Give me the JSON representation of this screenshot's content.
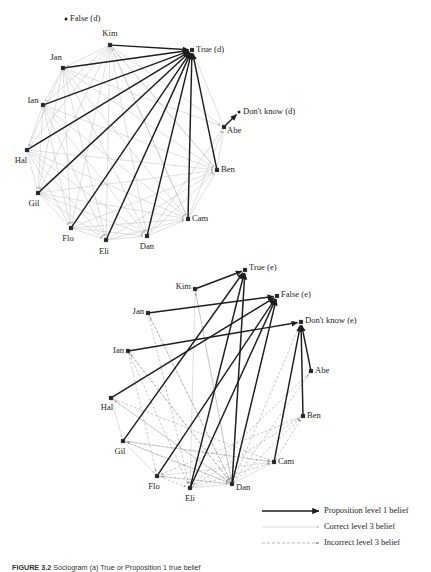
{
  "figure": {
    "caption_prefix": "FIGURE 3.2",
    "caption_text": "Sociogram (a) True or Proposition 1 true belief"
  },
  "colors": {
    "level1": "#1d1d1d",
    "correct3": "#b8b8b8",
    "incorrect3": "#9a9a9a",
    "node": "#222222",
    "text": "#1d1d1d"
  },
  "legend": {
    "items": [
      {
        "label": "Proposition level 1 belief",
        "style": "solid-thick",
        "color": "#1d1d1d"
      },
      {
        "label": "Correct level 3 belief",
        "style": "solid-thin",
        "color": "#bdbdbd"
      },
      {
        "label": "Incorrect level 3 belief",
        "style": "dashed",
        "color": "#9a9a9a"
      }
    ]
  },
  "chart_data": {
    "type": "diagram",
    "subtype": "directed-network",
    "panels": [
      {
        "id": "panel-d",
        "name": "dispositional-network",
        "suffix": "(d)",
        "nodes": [
          {
            "id": "False_d",
            "label": "False (d)",
            "x": 66,
            "y": 19,
            "lx": 70,
            "ly": 19,
            "anchor": "start",
            "kind": "proposition",
            "marker": "dot"
          },
          {
            "id": "Kim",
            "label": "Kim",
            "x": 110,
            "y": 45,
            "lx": 110,
            "ly": 34,
            "anchor": "middle",
            "kind": "agent",
            "marker": "square"
          },
          {
            "id": "True_d",
            "label": "True (d)",
            "x": 192,
            "y": 50,
            "lx": 196,
            "ly": 50,
            "anchor": "start",
            "kind": "proposition",
            "marker": "square"
          },
          {
            "id": "Jan",
            "label": "Jan",
            "x": 63,
            "y": 68,
            "lx": 56,
            "ly": 58,
            "anchor": "middle",
            "kind": "agent",
            "marker": "square"
          },
          {
            "id": "Ian",
            "label": "Ian",
            "x": 43,
            "y": 105,
            "lx": 33,
            "ly": 101,
            "anchor": "middle",
            "kind": "agent",
            "marker": "square"
          },
          {
            "id": "Dk_d",
            "label": "Don't know (d)",
            "x": 239,
            "y": 112,
            "lx": 243,
            "ly": 112,
            "anchor": "start",
            "kind": "proposition",
            "marker": "dot"
          },
          {
            "id": "Abe",
            "label": "Abe",
            "x": 224,
            "y": 127,
            "lx": 227,
            "ly": 131,
            "anchor": "start",
            "kind": "agent",
            "marker": "square"
          },
          {
            "id": "Hal",
            "label": "Hal",
            "x": 27,
            "y": 150,
            "lx": 21,
            "ly": 161,
            "anchor": "middle",
            "kind": "agent",
            "marker": "square"
          },
          {
            "id": "Ben",
            "label": "Ben",
            "x": 217,
            "y": 170,
            "lx": 221,
            "ly": 170,
            "anchor": "start",
            "kind": "agent",
            "marker": "square"
          },
          {
            "id": "Gil",
            "label": "Gil",
            "x": 38,
            "y": 193,
            "lx": 34,
            "ly": 204,
            "anchor": "middle",
            "kind": "agent",
            "marker": "square"
          },
          {
            "id": "Cam",
            "label": "Cam",
            "x": 188,
            "y": 219,
            "lx": 192,
            "ly": 219,
            "anchor": "start",
            "kind": "agent",
            "marker": "square"
          },
          {
            "id": "Flo",
            "label": "Flo",
            "x": 71,
            "y": 228,
            "lx": 68,
            "ly": 239,
            "anchor": "middle",
            "kind": "agent",
            "marker": "square"
          },
          {
            "id": "Dan",
            "label": "Dan",
            "x": 147,
            "y": 236,
            "lx": 147,
            "ly": 247,
            "anchor": "middle",
            "kind": "agent",
            "marker": "square"
          },
          {
            "id": "Eli",
            "label": "Eli",
            "x": 106,
            "y": 240,
            "lx": 104,
            "ly": 252,
            "anchor": "middle",
            "kind": "agent",
            "marker": "square"
          }
        ],
        "edges_level1": [
          [
            "Kim",
            "True_d"
          ],
          [
            "Jan",
            "True_d"
          ],
          [
            "Ian",
            "True_d"
          ],
          [
            "Hal",
            "True_d"
          ],
          [
            "Gil",
            "True_d"
          ],
          [
            "Flo",
            "True_d"
          ],
          [
            "Eli",
            "True_d"
          ],
          [
            "Dan",
            "True_d"
          ],
          [
            "Cam",
            "True_d"
          ],
          [
            "Ben",
            "True_d"
          ],
          [
            "Abe",
            "Dk_d"
          ]
        ],
        "edges_correct3": [
          [
            "Kim",
            "Jan"
          ],
          [
            "Kim",
            "Ian"
          ],
          [
            "Kim",
            "Hal"
          ],
          [
            "Kim",
            "Gil"
          ],
          [
            "Kim",
            "Flo"
          ],
          [
            "Kim",
            "Eli"
          ],
          [
            "Kim",
            "Dan"
          ],
          [
            "Kim",
            "Cam"
          ],
          [
            "Kim",
            "Ben"
          ],
          [
            "Kim",
            "Abe"
          ],
          [
            "Jan",
            "Ian"
          ],
          [
            "Jan",
            "Hal"
          ],
          [
            "Jan",
            "Gil"
          ],
          [
            "Jan",
            "Flo"
          ],
          [
            "Jan",
            "Eli"
          ],
          [
            "Jan",
            "Dan"
          ],
          [
            "Jan",
            "Cam"
          ],
          [
            "Jan",
            "Ben"
          ],
          [
            "Jan",
            "Abe"
          ],
          [
            "Ian",
            "Hal"
          ],
          [
            "Ian",
            "Gil"
          ],
          [
            "Ian",
            "Flo"
          ],
          [
            "Ian",
            "Eli"
          ],
          [
            "Ian",
            "Dan"
          ],
          [
            "Ian",
            "Cam"
          ],
          [
            "Ian",
            "Ben"
          ],
          [
            "Hal",
            "Gil"
          ],
          [
            "Hal",
            "Flo"
          ],
          [
            "Hal",
            "Eli"
          ],
          [
            "Hal",
            "Dan"
          ],
          [
            "Hal",
            "Cam"
          ],
          [
            "Hal",
            "Ben"
          ],
          [
            "Gil",
            "Flo"
          ],
          [
            "Gil",
            "Eli"
          ],
          [
            "Gil",
            "Dan"
          ],
          [
            "Gil",
            "Cam"
          ],
          [
            "Gil",
            "Ben"
          ],
          [
            "Flo",
            "Eli"
          ],
          [
            "Flo",
            "Dan"
          ],
          [
            "Flo",
            "Cam"
          ],
          [
            "Flo",
            "Ben"
          ],
          [
            "Eli",
            "Dan"
          ],
          [
            "Eli",
            "Cam"
          ],
          [
            "Eli",
            "Ben"
          ],
          [
            "Dan",
            "Cam"
          ],
          [
            "Dan",
            "Ben"
          ],
          [
            "Dan",
            "Abe"
          ],
          [
            "Cam",
            "Ben"
          ],
          [
            "Cam",
            "Abe"
          ],
          [
            "Ben",
            "Abe"
          ],
          [
            "Abe",
            "True_d"
          ],
          [
            "Ben",
            "Kim"
          ],
          [
            "Cam",
            "Kim"
          ]
        ],
        "edges_incorrect3": []
      },
      {
        "id": "panel-e",
        "name": "episodic-network",
        "suffix": "(e)",
        "nodes": [
          {
            "id": "True_e",
            "label": "True (e)",
            "x": 245,
            "y": 270,
            "lx": 249,
            "ly": 268,
            "anchor": "start",
            "kind": "proposition",
            "marker": "square"
          },
          {
            "id": "Kim",
            "label": "Kim",
            "x": 195,
            "y": 289,
            "lx": 191,
            "ly": 287,
            "anchor": "end",
            "kind": "agent",
            "marker": "square"
          },
          {
            "id": "False_e",
            "label": "False (e)",
            "x": 277,
            "y": 296,
            "lx": 281,
            "ly": 295,
            "anchor": "start",
            "kind": "proposition",
            "marker": "square"
          },
          {
            "id": "Jan",
            "label": "Jan",
            "x": 148,
            "y": 313,
            "lx": 144,
            "ly": 312,
            "anchor": "end",
            "kind": "agent",
            "marker": "square"
          },
          {
            "id": "Dk_e",
            "label": "Don't know (e)",
            "x": 301,
            "y": 322,
            "lx": 305,
            "ly": 321,
            "anchor": "start",
            "kind": "proposition",
            "marker": "square"
          },
          {
            "id": "Ian",
            "label": "Ian",
            "x": 128,
            "y": 351,
            "lx": 124,
            "ly": 351,
            "anchor": "end",
            "kind": "agent",
            "marker": "square"
          },
          {
            "id": "Abe",
            "label": "Abe",
            "x": 311,
            "y": 371,
            "lx": 315,
            "ly": 371,
            "anchor": "start",
            "kind": "agent",
            "marker": "square"
          },
          {
            "id": "Hal",
            "label": "Hal",
            "x": 111,
            "y": 398,
            "lx": 107,
            "ly": 408,
            "anchor": "middle",
            "kind": "agent",
            "marker": "square"
          },
          {
            "id": "Ben",
            "label": "Ben",
            "x": 303,
            "y": 416,
            "lx": 307,
            "ly": 416,
            "anchor": "start",
            "kind": "agent",
            "marker": "square"
          },
          {
            "id": "Gil",
            "label": "Gil",
            "x": 123,
            "y": 441,
            "lx": 120,
            "ly": 452,
            "anchor": "middle",
            "kind": "agent",
            "marker": "square"
          },
          {
            "id": "Cam",
            "label": "Cam",
            "x": 274,
            "y": 462,
            "lx": 278,
            "ly": 462,
            "anchor": "start",
            "kind": "agent",
            "marker": "square"
          },
          {
            "id": "Flo",
            "label": "Flo",
            "x": 157,
            "y": 476,
            "lx": 154,
            "ly": 487,
            "anchor": "middle",
            "kind": "agent",
            "marker": "square"
          },
          {
            "id": "Dan",
            "label": "Dan",
            "x": 232,
            "y": 484,
            "lx": 236,
            "ly": 488,
            "anchor": "start",
            "kind": "agent",
            "marker": "square"
          },
          {
            "id": "Eli",
            "label": "Eli",
            "x": 190,
            "y": 488,
            "lx": 190,
            "ly": 499,
            "anchor": "middle",
            "kind": "agent",
            "marker": "square"
          }
        ],
        "edges_level1": [
          [
            "Kim",
            "True_e"
          ],
          [
            "Jan",
            "False_e"
          ],
          [
            "Ian",
            "Dk_e"
          ],
          [
            "Hal",
            "False_e"
          ],
          [
            "Gil",
            "True_e"
          ],
          [
            "Flo",
            "False_e"
          ],
          [
            "Eli",
            "True_e"
          ],
          [
            "Dan",
            "True_e"
          ],
          [
            "Dan",
            "False_e"
          ],
          [
            "Cam",
            "Dk_e"
          ],
          [
            "Ben",
            "Dk_e"
          ],
          [
            "Abe",
            "Dk_e"
          ],
          [
            "Eli",
            "False_e"
          ]
        ],
        "edges_correct3": [
          [
            "Kim",
            "Eli"
          ],
          [
            "Gil",
            "Flo"
          ],
          [
            "Flo",
            "Dan"
          ],
          [
            "Flo",
            "Cam"
          ],
          [
            "Hal",
            "Gil"
          ],
          [
            "Eli",
            "Dan"
          ],
          [
            "Dan",
            "Cam"
          ]
        ],
        "edges_incorrect3": [
          [
            "Kim",
            "Dan"
          ],
          [
            "Jan",
            "Dan"
          ],
          [
            "Jan",
            "Eli"
          ],
          [
            "Ian",
            "Dan"
          ],
          [
            "Ian",
            "Eli"
          ],
          [
            "Ian",
            "Flo"
          ],
          [
            "Hal",
            "Dan"
          ],
          [
            "Hal",
            "Cam"
          ],
          [
            "Gil",
            "Dan"
          ],
          [
            "Gil",
            "Cam"
          ],
          [
            "Flo",
            "Eli"
          ],
          [
            "Dan",
            "Abe"
          ],
          [
            "Dan",
            "Ben"
          ],
          [
            "Dan",
            "Dk_e"
          ],
          [
            "Dan",
            "Kim"
          ],
          [
            "Dan",
            "Jan"
          ],
          [
            "Dan",
            "Ian"
          ],
          [
            "Dan",
            "Hal"
          ],
          [
            "Dan",
            "Gil"
          ],
          [
            "Dan",
            "Flo"
          ],
          [
            "Eli",
            "Cam"
          ],
          [
            "Eli",
            "Ben"
          ],
          [
            "Cam",
            "Ben"
          ],
          [
            "Ben",
            "Flo"
          ],
          [
            "Cam",
            "Gil"
          ],
          [
            "Abe",
            "Eli"
          ],
          [
            "Dan",
            "True_e"
          ],
          [
            "Dan",
            "False_e"
          ]
        ]
      }
    ]
  }
}
